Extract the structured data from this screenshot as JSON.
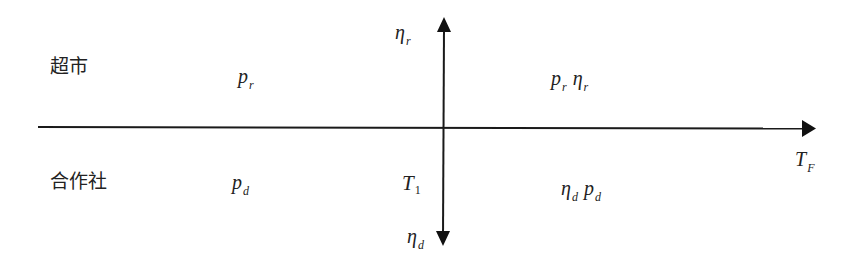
{
  "diagram": {
    "rows": [
      {
        "label": "超市"
      },
      {
        "label": "合作社"
      }
    ],
    "horizontal_axis": {
      "label_main": "T",
      "label_sub": "F"
    },
    "vertical_axis": {
      "top_label_main": "η",
      "top_label_sub": "r",
      "bottom_label_main": "η",
      "bottom_label_sub": "d"
    },
    "threshold": {
      "label_main": "T",
      "label_sub": "1"
    },
    "regions": {
      "top_left": [
        {
          "main": "p",
          "sub": "r"
        }
      ],
      "top_right": [
        {
          "main": "p",
          "sub": "r"
        },
        {
          "main": "η",
          "sub": "r"
        }
      ],
      "bottom_left": [
        {
          "main": "p",
          "sub": "d"
        }
      ],
      "bottom_right": [
        {
          "main": "η",
          "sub": "d"
        },
        {
          "main": "p",
          "sub": "d"
        }
      ]
    },
    "colors": {
      "line": "#1a1a1a",
      "background": "#ffffff"
    }
  }
}
